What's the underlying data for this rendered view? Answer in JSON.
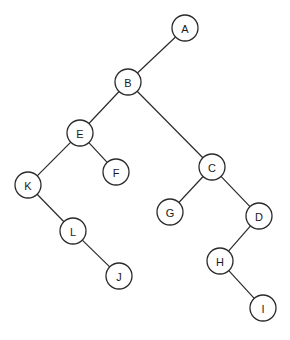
{
  "diagram": {
    "type": "binary-tree",
    "node_radius": 13,
    "colors": {
      "background": "#ffffff",
      "stroke": "#2a2a2a",
      "text": "#1a1a1a"
    },
    "nodes": [
      {
        "id": "A",
        "label": "A",
        "x": 185,
        "y": 28
      },
      {
        "id": "B",
        "label": "B",
        "x": 128,
        "y": 82
      },
      {
        "id": "E",
        "label": "E",
        "x": 80,
        "y": 133
      },
      {
        "id": "C",
        "label": "C",
        "x": 212,
        "y": 167
      },
      {
        "id": "F",
        "label": "F",
        "x": 116,
        "y": 172
      },
      {
        "id": "K",
        "label": "K",
        "x": 28,
        "y": 185
      },
      {
        "id": "G",
        "label": "G",
        "x": 170,
        "y": 212
      },
      {
        "id": "D",
        "label": "D",
        "x": 259,
        "y": 216
      },
      {
        "id": "L",
        "label": "L",
        "x": 73,
        "y": 231
      },
      {
        "id": "H",
        "label": "H",
        "x": 220,
        "y": 261
      },
      {
        "id": "J",
        "label": "J",
        "x": 119,
        "y": 276
      },
      {
        "id": "I",
        "label": "I",
        "x": 263,
        "y": 308
      }
    ],
    "edges": [
      {
        "from": "A",
        "to": "B"
      },
      {
        "from": "B",
        "to": "E"
      },
      {
        "from": "B",
        "to": "C"
      },
      {
        "from": "E",
        "to": "K"
      },
      {
        "from": "E",
        "to": "F"
      },
      {
        "from": "K",
        "to": "L"
      },
      {
        "from": "L",
        "to": "J"
      },
      {
        "from": "C",
        "to": "G"
      },
      {
        "from": "C",
        "to": "D"
      },
      {
        "from": "D",
        "to": "H"
      },
      {
        "from": "H",
        "to": "I"
      }
    ]
  }
}
